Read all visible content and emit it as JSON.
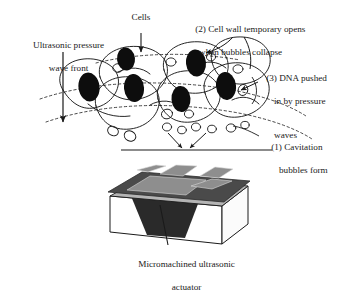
{
  "figure": {
    "type": "diagram",
    "background_color": "#ffffff",
    "ink_color": "#1a1a1a"
  },
  "labels": {
    "wave_front": {
      "line1": "Ultrasonic pressure",
      "line2": "wave front"
    },
    "cells": "Cells",
    "step2": {
      "line1": "(2) Cell wall temporary opens",
      "line2": "when bubbles collapse"
    },
    "step3": {
      "line1": "(3) DNA pushed",
      "line2": "in by pressure",
      "line3": "waves"
    },
    "step1": {
      "line1": "(1) Cavitation",
      "line2": "bubbles form"
    },
    "caption": {
      "line1": "Micromachined ultrasonic",
      "line2": "actuator"
    }
  },
  "actuator": {
    "top_plate_color": "#4a4a4a",
    "electrode_color": "#8e8e8e",
    "side_color": "#b4b4b4",
    "body_color": "#ffffff",
    "cavity_color": "#2a2a2a",
    "electrode_count": 5
  },
  "cells": {
    "nucleus_color": "#0d0d0d",
    "membrane_color": "#1a1a1a",
    "count": 7,
    "bubble_count": 14
  }
}
